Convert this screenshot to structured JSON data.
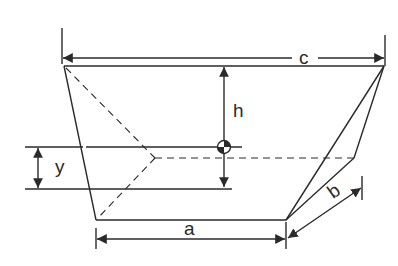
{
  "diagram": {
    "type": "geometry-figure",
    "labels": {
      "top_width": "c",
      "bottom_width": "a",
      "height": "h",
      "depth": "b",
      "centroid_offset": "y"
    },
    "colors": {
      "line": "#2a2a2a",
      "background": "#ffffff"
    },
    "elements": {
      "centroid_symbol": "centroid-icon"
    }
  }
}
